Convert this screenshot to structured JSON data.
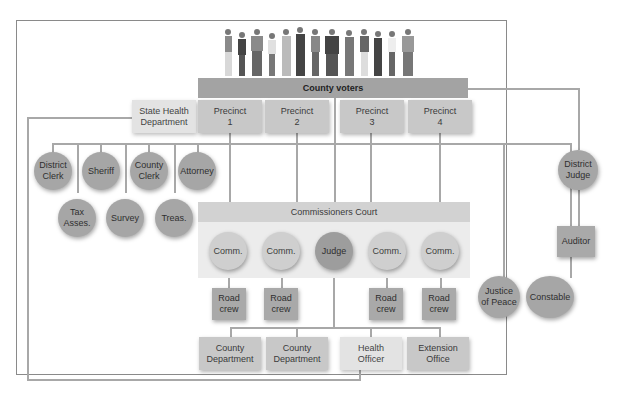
{
  "diagram": {
    "title_bar": "County voters",
    "precincts": [
      {
        "label": "Precinct",
        "number": "1"
      },
      {
        "label": "Precinct",
        "number": "2"
      },
      {
        "label": "Precinct",
        "number": "3"
      },
      {
        "label": "Precinct",
        "number": "4"
      }
    ],
    "state_health": {
      "line1": "State Health",
      "line2": "Department"
    },
    "elected_row1": [
      {
        "line1": "District",
        "line2": "Clerk"
      },
      {
        "line1": "Sheriff",
        "line2": ""
      },
      {
        "line1": "County",
        "line2": "Clerk"
      },
      {
        "line1": "Attorney",
        "line2": ""
      }
    ],
    "elected_row2": [
      {
        "line1": "Tax",
        "line2": "Asses."
      },
      {
        "line1": "Survey",
        "line2": ""
      },
      {
        "line1": "Treas.",
        "line2": ""
      }
    ],
    "commissioners_court": "Commissioners Court",
    "court_members": [
      {
        "label": "Comm."
      },
      {
        "label": "Comm."
      },
      {
        "label": "Judge"
      },
      {
        "label": "Comm."
      },
      {
        "label": "Comm."
      }
    ],
    "road_crews": [
      {
        "line1": "Road",
        "line2": "crew"
      },
      {
        "line1": "Road",
        "line2": "crew"
      },
      {
        "line1": "Road",
        "line2": "crew"
      },
      {
        "line1": "Road",
        "line2": "crew"
      }
    ],
    "departments": [
      {
        "line1": "County",
        "line2": "Department"
      },
      {
        "line1": "County",
        "line2": "Department"
      },
      {
        "line1": "Health",
        "line2": "Officer"
      },
      {
        "line1": "Extension",
        "line2": "Office"
      }
    ],
    "justice": {
      "line1": "Justice",
      "line2": "of Peace"
    },
    "constable": {
      "label": "Constable"
    },
    "district_judge": {
      "line1": "District",
      "line2": "Judge"
    },
    "auditor": {
      "label": "Auditor"
    }
  },
  "colors": {
    "dark_node": "#a9a9a9",
    "light_node": "#cfcfcf",
    "line": "#a8a8a8",
    "frame": "#8a8a8a"
  }
}
